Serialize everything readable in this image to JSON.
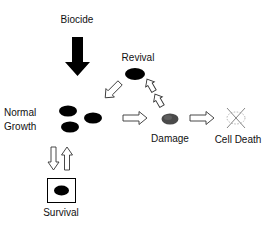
{
  "diagram": {
    "type": "process-flow",
    "nodes": {
      "biocide": {
        "label": "Biocide"
      },
      "revival": {
        "label": "Revival"
      },
      "normal_growth": {
        "label_line1": "Normal",
        "label_line2": "Growth"
      },
      "damage": {
        "label": "Damage"
      },
      "cell_death": {
        "label": "Cell Death"
      },
      "survival": {
        "label": "Survival"
      }
    },
    "edges": [
      {
        "from": "biocide",
        "to": "normal_growth",
        "style": "solid-black-arrow"
      },
      {
        "from": "revival",
        "to": "normal_growth",
        "style": "hollow-arrow"
      },
      {
        "from": "normal_growth",
        "to": "damage",
        "style": "hollow-arrow"
      },
      {
        "from": "damage",
        "to": "revival",
        "style": "hollow-arrow"
      },
      {
        "from": "damage",
        "to": "cell_death",
        "style": "hollow-arrow"
      },
      {
        "from": "normal_growth",
        "to": "survival",
        "style": "hollow-arrow"
      },
      {
        "from": "survival",
        "to": "normal_growth",
        "style": "hollow-arrow"
      }
    ],
    "colors": {
      "cell": "#000000",
      "damaged_cell": "#444444",
      "dead_cell_outline": "#999999",
      "arrow_outline": "#333333",
      "text": "#111111"
    }
  }
}
